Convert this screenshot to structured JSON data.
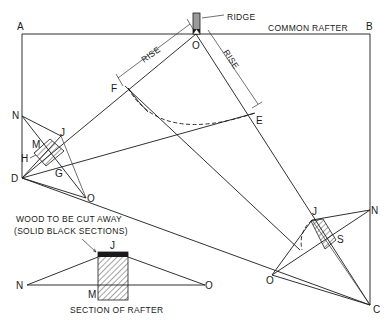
{
  "diagram": {
    "labels": {
      "A": "A",
      "B": "B",
      "C": "C",
      "D": "D",
      "E": "E",
      "F": "F",
      "G": "G",
      "H": "H",
      "J_left": "J",
      "M_left": "M",
      "N_left": "N",
      "O_top": "O",
      "O_left": "O",
      "J_right": "J",
      "N_right": "N",
      "S_right": "S",
      "O_right": "O",
      "J_section": "J",
      "M_section": "M",
      "N_section": "N",
      "O_section": "O"
    },
    "annotations": {
      "ridge": "RIDGE",
      "common_rafter": "COMMON RAFTER",
      "rise_left": "RISE",
      "rise_right": "RISE",
      "wood_cut_line1": "WOOD TO BE CUT AWAY",
      "wood_cut_line2": "(SOLID BLACK SECTIONS)",
      "section_caption": "SECTION OF RAFTER"
    },
    "colors": {
      "line": "#1a1a1a",
      "background": "#ffffff",
      "ridge_fill": "#9a9a9a"
    }
  }
}
